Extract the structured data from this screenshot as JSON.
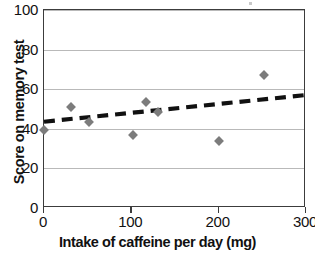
{
  "chart_data": {
    "type": "scatter",
    "title": "",
    "xlabel": "Intake of caffeine per day (mg)",
    "ylabel": "Score on memory test",
    "xlim": [
      0,
      300
    ],
    "ylim": [
      0,
      100
    ],
    "xticks": [
      0,
      100,
      200,
      300
    ],
    "yticks": [
      0,
      20,
      40,
      60,
      80,
      100
    ],
    "grid": "horizontal",
    "legend": "none",
    "marker_shape": "diamond",
    "marker_color": "#7c7c7c",
    "trendline": {
      "style": "dashed",
      "color": "#111111",
      "x_start": 0,
      "y_start": 43,
      "x_end": 300,
      "y_end": 56.5
    },
    "points": [
      {
        "x": 0,
        "y": 39.5
      },
      {
        "x": 31,
        "y": 51
      },
      {
        "x": 51,
        "y": 43.5
      },
      {
        "x": 102,
        "y": 37
      },
      {
        "x": 117,
        "y": 53.5
      },
      {
        "x": 131,
        "y": 48.5
      },
      {
        "x": 200,
        "y": 34
      },
      {
        "x": 252,
        "y": 67
      }
    ]
  },
  "axes": {
    "x_tick_labels": [
      "0",
      "100",
      "200",
      "300"
    ],
    "y_tick_labels": [
      "0",
      "20",
      "40",
      "60",
      "80",
      "100"
    ],
    "x_title": "Intake of caffeine per day (mg)",
    "y_title": "Score on memory test"
  }
}
